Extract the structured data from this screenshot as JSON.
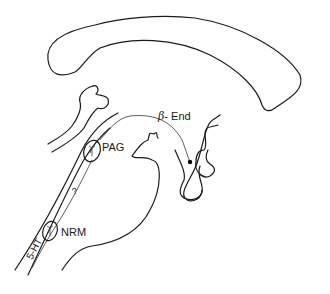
{
  "diagram": {
    "type": "brain-sagittal-section",
    "labels": {
      "beta_end": {
        "greek": "β",
        "text": "- End"
      },
      "pag": "PAG",
      "nrm": "NRM",
      "serotonin": "5-HT",
      "question": "?"
    },
    "colors": {
      "stroke": "#1a1a1a",
      "background": "#ffffff"
    }
  }
}
